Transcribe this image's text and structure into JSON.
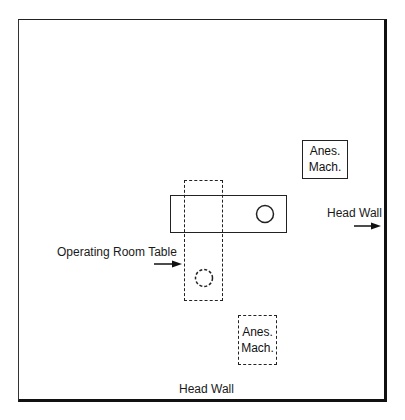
{
  "diagram": {
    "type": "operating-room-layout",
    "labels": {
      "head_wall_right": "Head Wall",
      "head_wall_bottom": "Head Wall",
      "operating_room_table": "Operating Room Table"
    },
    "anesthesia_machines": [
      {
        "line1": "Anes.",
        "line2": "Mach.",
        "style": "solid",
        "position": "upper-right"
      },
      {
        "line1": "Anes.",
        "line2": "Mach.",
        "style": "dashed",
        "position": "lower-center"
      }
    ],
    "tables": [
      {
        "style": "solid",
        "orientation": "horizontal",
        "head_marker": "solid-circle"
      },
      {
        "style": "dashed",
        "orientation": "vertical",
        "head_marker": "dashed-circle"
      }
    ],
    "colors": {
      "line": "#222222",
      "background": "#ffffff"
    }
  }
}
